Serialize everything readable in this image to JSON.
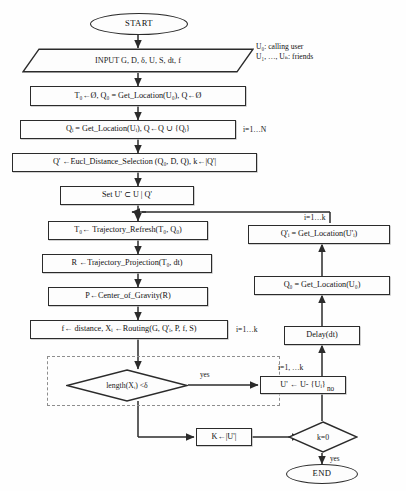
{
  "diagram": {
    "type": "flowchart",
    "stroke_color": "#2b2b2b",
    "dashed_color": "#8e8e8e",
    "background": "#ffffff"
  },
  "nodes": {
    "start": {
      "label": "START",
      "shape": "terminator"
    },
    "input": {
      "label": "INPUT G, D, δ, U, S, dt, f",
      "shape": "parallelogram"
    },
    "init": {
      "label": "T₀←Ø, Q₀ = Get_Location(U₀), Q←Ø",
      "shape": "process"
    },
    "getloc_i": {
      "label": "Qᵢ = Get_Location(Uᵢ), Q←Q ∪ {Qᵢ}",
      "shape": "process"
    },
    "eucl": {
      "label": "Q' ←Eucl_Distance_Selection (Q₀, D, Q), k←|Q'|",
      "shape": "process"
    },
    "setu": {
      "label": "Set U' ⊂ U | Q'",
      "shape": "process"
    },
    "traj_refresh": {
      "label": "T₀← Trajectory_Refresh(T₀, Q₀)",
      "shape": "process"
    },
    "traj_proj": {
      "label": "R ←Trajectory_Projection(T₀, dt)",
      "shape": "process"
    },
    "center": {
      "label": "P←Center_of_Gravity(R)",
      "shape": "process"
    },
    "routing": {
      "label": "f← distance, Xᵢ ←Routing(G, Q'ᵢ, P, f, S)",
      "shape": "process"
    },
    "length_dec": {
      "label": "length(Xᵢ) <δ",
      "shape": "decision"
    },
    "remove_u": {
      "label": "U' ← U- {Uᵢ}",
      "shape": "process"
    },
    "k_assign": {
      "label": "K←|U'|",
      "shape": "process"
    },
    "k_zero": {
      "label": "k=0",
      "shape": "decision"
    },
    "end": {
      "label": "END",
      "shape": "terminator"
    },
    "delay": {
      "label": "Delay(dt)",
      "shape": "process"
    },
    "getloc_u0": {
      "label": "Q₀ = Get_Location(U₀)",
      "shape": "process"
    },
    "getloc_ui": {
      "label": "Q'ᵢ = Get_Location(U'ᵢ)",
      "shape": "process"
    }
  },
  "annotations": {
    "legend_users": "U₀: calling user\nU₁, …, Uₙ: friends",
    "loop_i_n": "i=1…N",
    "loop_i_k_right": "i=1…k",
    "loop_i_k_routing": "i=1…k",
    "loop_i_k_dashed": "i=1, …k"
  },
  "edge_labels": {
    "yes_length": "yes",
    "no_k": "no",
    "yes_k": "yes"
  }
}
